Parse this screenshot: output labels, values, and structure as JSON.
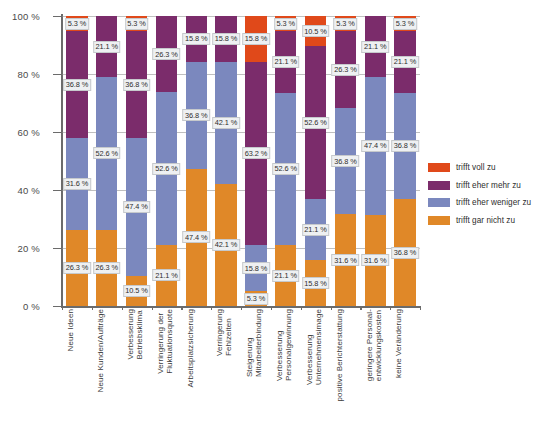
{
  "chart_data": {
    "type": "bar",
    "subtype": "stacked-bar-100-percent",
    "title": "",
    "xlabel": "",
    "ylabel": "",
    "ylim": [
      0,
      100
    ],
    "yticks": [
      "0 %",
      "20 %",
      "40 %",
      "60 %",
      "80 %",
      "100 %"
    ],
    "ytick_values": [
      0,
      20,
      40,
      60,
      80,
      100
    ],
    "grid": true,
    "legend_position": "right",
    "unit": "%",
    "stack_order_top_to_bottom": [
      "trifft voll zu",
      "trifft eher mehr zu",
      "trifft eher weniger zu",
      "trifft gar nicht zu"
    ],
    "categories": [
      "Neue Ideen",
      "Neue Kunden/Aufträge",
      "Verbesserung\nBetriebsklima",
      "Verringerung der\nFluktuationsquote",
      "Arbeitsplatzsicherung",
      "Verringerung\nFehlzeiten",
      "Steigerung\nMitarbeiterbindung",
      "Verbesserung\nPersonalgewinnung",
      "Verbesserung\nUnternehmensimage",
      "positive Berichterstattung",
      "geringere Personal-\nentwicklungskosten",
      "keine Veränderung"
    ],
    "series": [
      {
        "name": "trifft voll zu",
        "color": "#E0491A",
        "values": [
          5.3,
          0,
          5.3,
          0,
          0,
          0,
          15.8,
          5.3,
          10.5,
          5.3,
          0,
          5.3
        ],
        "labels": [
          "5.3 %",
          "",
          "5.3 %",
          "",
          "",
          "",
          "15.8 %",
          "5.3 %",
          "10.5 %",
          "5.3 %",
          "",
          "5.3 %"
        ]
      },
      {
        "name": "trifft eher mehr zu",
        "color": "#7B2C6B",
        "values": [
          36.8,
          21.1,
          36.8,
          26.3,
          15.8,
          15.8,
          63.2,
          21.1,
          52.6,
          26.3,
          21.1,
          21.1
        ],
        "labels": [
          "36.8 %",
          "21.1 %",
          "36.8 %",
          "26.3 %",
          "15.8 %",
          "15.8 %",
          "63.2 %",
          "21.1 %",
          "52.6 %",
          "26.3 %",
          "21.1 %",
          "21.1 %"
        ]
      },
      {
        "name": "trifft eher weniger zu",
        "color": "#7B88BE",
        "values": [
          31.6,
          52.6,
          47.4,
          52.6,
          36.8,
          42.1,
          15.8,
          52.6,
          21.1,
          36.8,
          47.4,
          36.8
        ],
        "labels": [
          "31.6 %",
          "52.6 %",
          "47.4 %",
          "52.6 %",
          "36.8 %",
          "42.1 %",
          "15.8 %",
          "52.6 %",
          "21.1 %",
          "36.8 %",
          "47.4 %",
          "36.8 %"
        ]
      },
      {
        "name": "trifft gar nicht zu",
        "color": "#E08828",
        "values": [
          26.3,
          26.3,
          10.5,
          21.1,
          47.4,
          42.1,
          5.3,
          21.1,
          15.8,
          31.6,
          31.6,
          36.8
        ],
        "labels": [
          "26.3 %",
          "26.3 %",
          "10.5 %",
          "21.1 %",
          "47.4 %",
          "42.1 %",
          "5.3 %",
          "21.1 %",
          "15.8 %",
          "31.6 %",
          "31.6 %",
          "36.8 %"
        ]
      }
    ]
  },
  "legend": {
    "items": [
      {
        "label": "trifft voll zu",
        "color": "#E0491A"
      },
      {
        "label": "trifft eher mehr zu",
        "color": "#7B2C6B"
      },
      {
        "label": "trifft eher weniger zu",
        "color": "#7B88BE"
      },
      {
        "label": "trifft gar nicht zu",
        "color": "#E08828"
      }
    ]
  }
}
